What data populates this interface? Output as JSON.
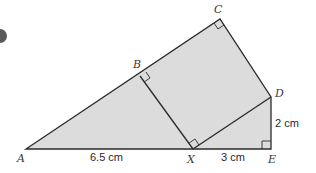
{
  "diagram": {
    "title": "",
    "colors": {
      "fill": "#dcdcdc",
      "stroke": "#2b2b2b",
      "badge": "#5a5a5a"
    },
    "points": {
      "A": {
        "label": "A",
        "x": 26,
        "y": 149
      },
      "B": {
        "label": "B",
        "x": 140,
        "y": 76
      },
      "C": {
        "label": "C",
        "x": 220,
        "y": 19
      },
      "D": {
        "label": "D",
        "x": 271,
        "y": 97
      },
      "X": {
        "label": "X",
        "x": 193,
        "y": 149
      },
      "E": {
        "label": "E",
        "x": 271,
        "y": 149
      }
    },
    "lengths": {
      "AX": "6.5 cm",
      "XE": "3 cm",
      "DE": "2 cm"
    },
    "right_angles": [
      "B",
      "C",
      "X",
      "E"
    ],
    "segments": [
      "A-C",
      "C-D",
      "D-E",
      "E-A",
      "B-X",
      "X-D"
    ]
  }
}
